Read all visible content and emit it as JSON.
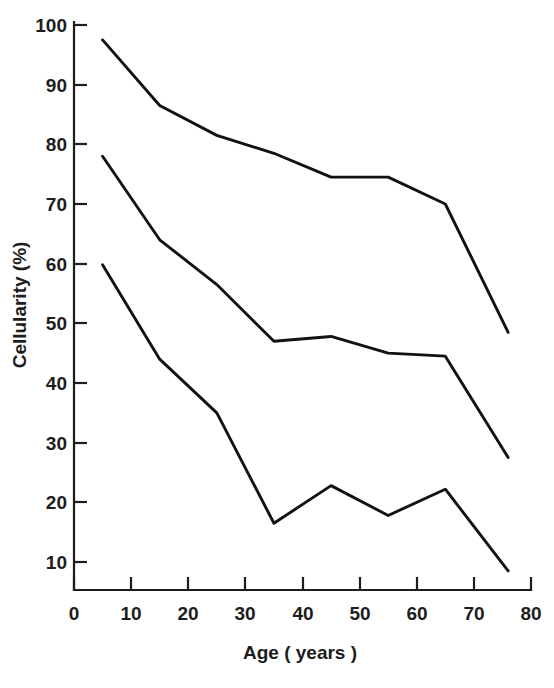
{
  "chart_data": {
    "type": "line",
    "title": "",
    "xlabel": "Age ( years )",
    "ylabel": "Cellularity (%)",
    "xlim": [
      0,
      80
    ],
    "ylim": [
      0,
      100
    ],
    "xticks": [
      0,
      10,
      20,
      30,
      40,
      50,
      60,
      70,
      80
    ],
    "xtick_labels": [
      "0",
      "10",
      "20",
      "30",
      "40",
      "50",
      "60",
      "70",
      "80"
    ],
    "yticks": [
      10,
      20,
      30,
      40,
      50,
      60,
      70,
      80,
      90,
      100
    ],
    "ytick_labels": [
      "10",
      "20",
      "30",
      "40",
      "50",
      "60",
      "70",
      "80",
      "90",
      "100"
    ],
    "grid": false,
    "legend": false,
    "legend_position": "none",
    "line_color": "#121212",
    "x": [
      5,
      15,
      25,
      35,
      45,
      55,
      65,
      76
    ],
    "series": [
      {
        "name": "upper",
        "values": [
          97.5,
          86.5,
          81.5,
          78.5,
          74.5,
          74.5,
          70.0,
          48.5
        ]
      },
      {
        "name": "middle",
        "values": [
          78.0,
          64.0,
          56.5,
          47.0,
          47.8,
          45.0,
          44.5,
          27.5
        ]
      },
      {
        "name": "lower",
        "values": [
          59.8,
          44.0,
          35.0,
          16.5,
          22.8,
          17.8,
          22.2,
          8.5
        ]
      }
    ]
  },
  "axes": {
    "x_title": "Age ( years )",
    "y_title": "Cellularity (%)"
  }
}
